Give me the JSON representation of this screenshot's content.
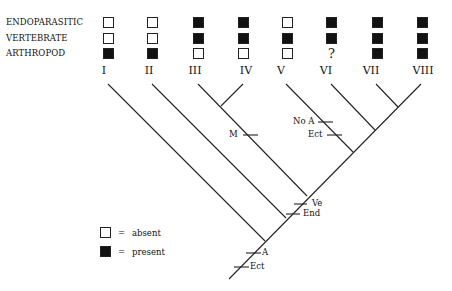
{
  "characters": [
    "ENDOPARASITIC",
    "VERTEBRATE",
    "ARTHROPOD"
  ],
  "taxa": [
    {
      "label": "I",
      "states": [
        "absent",
        "absent",
        "present"
      ]
    },
    {
      "label": "II",
      "states": [
        "absent",
        "absent",
        "present"
      ]
    },
    {
      "label": "III",
      "states": [
        "present",
        "present",
        "absent"
      ]
    },
    {
      "label": "IV",
      "states": [
        "present",
        "present",
        "absent"
      ]
    },
    {
      "label": "V",
      "states": [
        "absent",
        "present",
        "absent"
      ]
    },
    {
      "label": "VI",
      "states": [
        "present",
        "present",
        "unknown"
      ]
    },
    {
      "label": "VII",
      "states": [
        "present",
        "present",
        "present"
      ]
    },
    {
      "label": "VIII",
      "states": [
        "present",
        "present",
        "present"
      ]
    }
  ],
  "unknown_symbol": "?",
  "character_marks": {
    "m": "M",
    "no_a": "No A",
    "ect_v": "Ect",
    "ve": "Ve",
    "end": "End",
    "a": "A",
    "ect_root": "Ect"
  },
  "legend": {
    "absent": "absent",
    "present": "present",
    "equals": "="
  },
  "colors": {
    "present": "#111111",
    "absent": "#ffffff",
    "line": "#222222"
  }
}
